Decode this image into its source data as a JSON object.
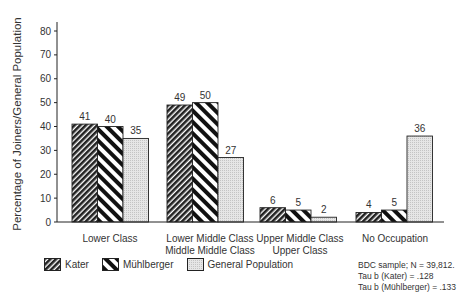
{
  "chart_data": {
    "type": "bar",
    "title": "",
    "xlabel": "",
    "ylabel": "Percentage of Joiners/General Population",
    "ylim": [
      0,
      80
    ],
    "yticks": [
      0,
      10,
      20,
      30,
      40,
      50,
      60,
      70,
      80
    ],
    "grid": false,
    "legend_position": "bottom",
    "categories": [
      "Lower Class",
      "Lower Middle Class\nMiddle Middle Class",
      "Upper Middle Class\nUpper Class",
      "No Occupation"
    ],
    "series": [
      {
        "name": "Kater",
        "values": [
          41,
          49,
          6,
          4
        ],
        "pattern": "dense-diagonal-hatch"
      },
      {
        "name": "Mühlberger",
        "values": [
          40,
          50,
          5,
          5
        ],
        "pattern": "wide-diagonal-stripes"
      },
      {
        "name": "General Population",
        "values": [
          35,
          27,
          2,
          36
        ],
        "pattern": "light-gray-dots"
      }
    ],
    "annotations": [
      "BDC sample; N = 39,812.",
      "Tau b (Kater) = .128",
      "Tau b (Mühlberger) = .133"
    ]
  },
  "axis": {
    "ylabel": "Percentage of Joiners/General Population",
    "ticks": [
      "0",
      "10",
      "20",
      "30",
      "40",
      "50",
      "60",
      "70",
      "80"
    ]
  },
  "categories": [
    {
      "line1": "Lower Class",
      "line2": ""
    },
    {
      "line1": "Lower Middle Class",
      "line2": "Middle Middle Class"
    },
    {
      "line1": "Upper Middle Class",
      "line2": "Upper Class"
    },
    {
      "line1": "No Occupation",
      "line2": ""
    }
  ],
  "legend": {
    "kater": "Kater",
    "muhlberger": "Mühlberger",
    "general": "General Population"
  },
  "note": {
    "line1": "BDC sample; N = 39,812.",
    "line2": "Tau b (Kater) = .128",
    "line3": "Tau b (Mühlberger) = .133"
  },
  "colors": {
    "axis": "#222222",
    "dark_hatch": "#222222",
    "gray_fill": "#d9d9d9"
  }
}
